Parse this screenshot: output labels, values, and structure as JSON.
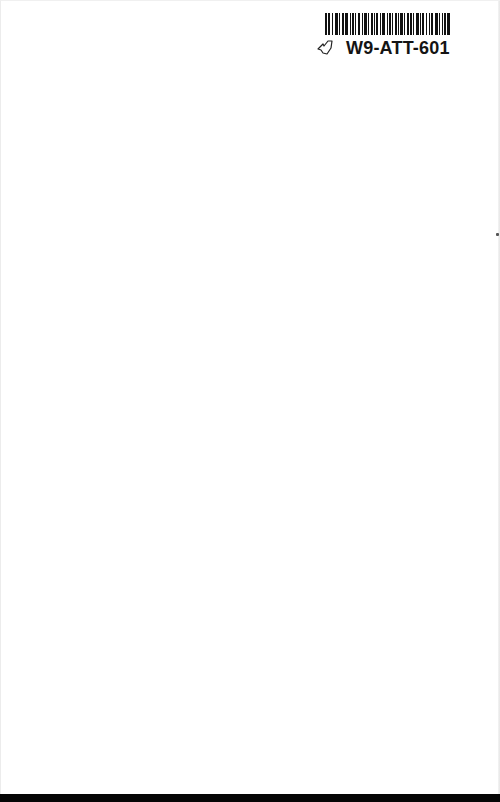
{
  "page": {
    "background": "#ffffff",
    "bottom_band_color": "#050505"
  },
  "sticker": {
    "code": "W9-ATT-601",
    "icon": "leaf-outline-icon",
    "barcode_bars": [
      2,
      1,
      2,
      2,
      1,
      2,
      3,
      1,
      1,
      2,
      2,
      1,
      3,
      2,
      1,
      1,
      2,
      1,
      1,
      2,
      2,
      2,
      1,
      1,
      3,
      1,
      1,
      2,
      2,
      1,
      1,
      1,
      2,
      2,
      1,
      1,
      3,
      2,
      1,
      1,
      2,
      1,
      1,
      2,
      2,
      1,
      1,
      1,
      3,
      1,
      1,
      2,
      2,
      1,
      2,
      1,
      1,
      2,
      3,
      1,
      1,
      1,
      2,
      2,
      1,
      2,
      1,
      1,
      2,
      2,
      3,
      1,
      1,
      2,
      1,
      1,
      2,
      1,
      3,
      2
    ]
  }
}
